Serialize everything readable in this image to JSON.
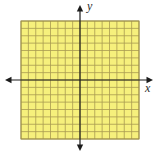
{
  "figure": {
    "axis_labels": {
      "x": "x",
      "y": "y"
    },
    "grid": {
      "columns": 16,
      "rows": 16,
      "x_range": [
        -8,
        8
      ],
      "y_range": [
        -8,
        8
      ],
      "tick_labels_shown": false,
      "plotted_data": "none"
    },
    "colors": {
      "page_background": "#ffffff",
      "grid_fill": "#f6f07c",
      "grid_line": "#a99b52",
      "grid_border": "#9a8d49",
      "axis": "#1c1c1c",
      "label": "#2b2b2b"
    }
  }
}
